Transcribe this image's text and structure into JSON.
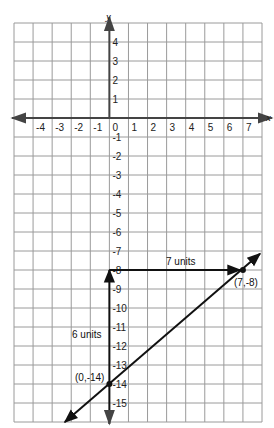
{
  "chart_data": {
    "type": "line",
    "title": "",
    "xlabel": "x",
    "ylabel": "y",
    "xlim": [
      -5,
      8
    ],
    "ylim": [
      -16,
      5
    ],
    "grid": true,
    "x_tick_labels": [
      "-4",
      "-3",
      "-2",
      "-1",
      "0",
      "1",
      "2",
      "3",
      "4",
      "5",
      "6",
      "7"
    ],
    "y_tick_labels": [
      "4",
      "3",
      "2",
      "1",
      "-1",
      "-2",
      "-3",
      "-4",
      "-5",
      "-6",
      "-7",
      "-8",
      "-9",
      "-10",
      "-11",
      "-12",
      "-13",
      "-14",
      "-15"
    ],
    "series": [
      {
        "name": "line",
        "points": [
          [
            0,
            -14
          ],
          [
            7,
            -8
          ]
        ],
        "slope": 0.857,
        "y_intercept": -14,
        "arrows_both_ends": true
      }
    ],
    "points": [
      {
        "x": 0,
        "y": -14,
        "label": "(0,-14)"
      },
      {
        "x": 7,
        "y": -8,
        "label": "(7,-8)"
      }
    ],
    "annotations": [
      {
        "type": "vertical-arrow",
        "from": [
          0,
          -14
        ],
        "to": [
          0,
          -8
        ],
        "label": "6 units"
      },
      {
        "type": "horizontal-arrow",
        "from": [
          0,
          -8
        ],
        "to": [
          7,
          -8
        ],
        "label": "7 units"
      }
    ]
  },
  "labels": {
    "x_axis": "x",
    "y_axis": "y",
    "rise": "6 units",
    "run": "7 units",
    "point_a": "(0,-14)",
    "point_b": "(7,-8)"
  },
  "colors": {
    "grid": "#9a9a9a",
    "axis": "#444444",
    "line": "#111111"
  }
}
